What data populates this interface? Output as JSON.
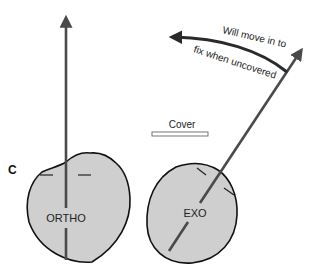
{
  "figure": {
    "panel_label": "C",
    "cover_label": "Cover",
    "annotation_line1": "Will move in to",
    "annotation_line2": "fix when uncovered",
    "eyes": [
      {
        "id": "ortho",
        "label": "ORTHO",
        "description": "Orthophoric eye, visual axis straight up"
      },
      {
        "id": "exo",
        "label": "EXO",
        "description": "Exodeviated eye, visual axis angled outward"
      }
    ],
    "colors": {
      "eye_fill": "#cfcfcf",
      "eye_stroke": "#111111",
      "axis_line": "#4a4a4a",
      "arrow": "#333333",
      "cover_fill": "#ffffff",
      "cover_stroke": "#666666"
    }
  }
}
